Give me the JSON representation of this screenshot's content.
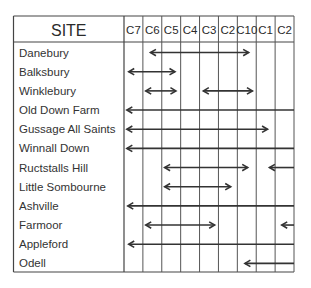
{
  "chart_data": {
    "type": "table",
    "title": "",
    "header": {
      "site_label": "SITE",
      "periods": [
        "C7",
        "C6",
        "C5",
        "C4",
        "C3",
        "C2",
        "C10",
        "C1",
        "C2"
      ]
    },
    "rows": [
      {
        "site": "Danebury",
        "spans": [
          {
            "start": 1.4,
            "end": 6.6,
            "left_head": true,
            "right_head": true
          }
        ]
      },
      {
        "site": "Balksbury",
        "spans": [
          {
            "start": 0.25,
            "end": 2.7,
            "left_head": true,
            "right_head": true
          }
        ]
      },
      {
        "site": "Winklebury",
        "spans": [
          {
            "start": 1.15,
            "end": 2.75,
            "left_head": true,
            "right_head": true
          },
          {
            "start": 4.2,
            "end": 6.8,
            "left_head": true,
            "right_head": true
          }
        ]
      },
      {
        "site": "Old Down Farm",
        "spans": [
          {
            "start": 0.15,
            "end": 9,
            "left_head": true,
            "right_head": false
          }
        ]
      },
      {
        "site": "Gussage All Saints",
        "spans": [
          {
            "start": 0.15,
            "end": 7.6,
            "left_head": true,
            "right_head": true
          }
        ]
      },
      {
        "site": "Winnall Down",
        "spans": [
          {
            "start": 0.15,
            "end": 9,
            "left_head": true,
            "right_head": false
          }
        ]
      },
      {
        "site": "Ructstalls Hill",
        "spans": [
          {
            "start": 2.15,
            "end": 6.55,
            "left_head": true,
            "right_head": true
          },
          {
            "start": 7.7,
            "end": 9,
            "left_head": true,
            "right_head": false
          }
        ]
      },
      {
        "site": "Little Sombourne",
        "spans": [
          {
            "start": 2.15,
            "end": 5.65,
            "left_head": true,
            "right_head": true
          }
        ]
      },
      {
        "site": "Ashville",
        "spans": [
          {
            "start": 0.2,
            "end": 9,
            "left_head": true,
            "right_head": false
          }
        ]
      },
      {
        "site": "Farmoor",
        "spans": [
          {
            "start": 1.15,
            "end": 4.8,
            "left_head": true,
            "right_head": true
          },
          {
            "start": 8.35,
            "end": 9,
            "left_head": true,
            "right_head": false
          }
        ]
      },
      {
        "site": "Appleford",
        "spans": [
          {
            "start": 0.25,
            "end": 9,
            "left_head": true,
            "right_head": false
          }
        ]
      },
      {
        "site": "Odell",
        "spans": [
          {
            "start": 6.4,
            "end": 9,
            "left_head": true,
            "right_head": false
          }
        ]
      }
    ]
  },
  "colors": {
    "line": "#333333",
    "grid": "#555555",
    "text": "#2a2a2a",
    "background": "#ffffff"
  }
}
